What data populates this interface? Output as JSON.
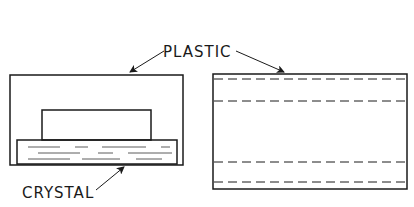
{
  "diagram": {
    "labels": {
      "plastic": "PLASTIC",
      "crystal": "CRYSTAL"
    },
    "views": [
      {
        "name": "side-section-view",
        "description": "Crystal embedded at base of plastic block"
      },
      {
        "name": "end-view",
        "description": "Plastic block with hidden dashed lines"
      }
    ],
    "colors": {
      "ink": "#1a1a1a",
      "background": "#ffffff"
    }
  }
}
